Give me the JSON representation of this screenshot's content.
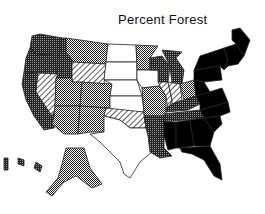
{
  "title": "Percent Forest",
  "categories": [
    {
      "id": "c0",
      "name": "lowest",
      "pattern": "white",
      "color": "#ffffff"
    },
    {
      "id": "c1",
      "name": "low",
      "pattern": "diagonal-hatch",
      "color": "#888888"
    },
    {
      "id": "c2",
      "name": "medium",
      "pattern": "dot-checker",
      "color": "#777777"
    },
    {
      "id": "c3",
      "name": "high",
      "pattern": "dark-checker",
      "color": "#444444"
    },
    {
      "id": "c4",
      "name": "highest",
      "pattern": "solid-black",
      "color": "#000000"
    }
  ],
  "states": [
    {
      "name": "Washington",
      "category": "c3"
    },
    {
      "name": "Oregon",
      "category": "c3"
    },
    {
      "name": "California",
      "category": "c3"
    },
    {
      "name": "Idaho",
      "category": "c3"
    },
    {
      "name": "Nevada",
      "category": "c1"
    },
    {
      "name": "Montana",
      "category": "c2"
    },
    {
      "name": "Wyoming",
      "category": "c1"
    },
    {
      "name": "Utah",
      "category": "c2"
    },
    {
      "name": "Arizona",
      "category": "c2"
    },
    {
      "name": "Colorado",
      "category": "c2"
    },
    {
      "name": "New Mexico",
      "category": "c2"
    },
    {
      "name": "North Dakota",
      "category": "c0"
    },
    {
      "name": "South Dakota",
      "category": "c0"
    },
    {
      "name": "Nebraska",
      "category": "c0"
    },
    {
      "name": "Kansas",
      "category": "c0"
    },
    {
      "name": "Oklahoma",
      "category": "c1"
    },
    {
      "name": "Texas",
      "category": "c0"
    },
    {
      "name": "Minnesota",
      "category": "c2"
    },
    {
      "name": "Iowa",
      "category": "c0"
    },
    {
      "name": "Missouri",
      "category": "c2"
    },
    {
      "name": "Arkansas",
      "category": "c3"
    },
    {
      "name": "Louisiana",
      "category": "c3"
    },
    {
      "name": "Wisconsin",
      "category": "c3"
    },
    {
      "name": "Michigan",
      "category": "c3"
    },
    {
      "name": "Illinois",
      "category": "c1"
    },
    {
      "name": "Indiana",
      "category": "c1"
    },
    {
      "name": "Ohio",
      "category": "c2"
    },
    {
      "name": "Kentucky",
      "category": "c3"
    },
    {
      "name": "Tennessee",
      "category": "c3"
    },
    {
      "name": "Mississippi",
      "category": "c4"
    },
    {
      "name": "Alabama",
      "category": "c4"
    },
    {
      "name": "Georgia",
      "category": "c4"
    },
    {
      "name": "Florida",
      "category": "c4"
    },
    {
      "name": "South Carolina",
      "category": "c4"
    },
    {
      "name": "North Carolina",
      "category": "c4"
    },
    {
      "name": "Virginia",
      "category": "c4"
    },
    {
      "name": "West Virginia",
      "category": "c4"
    },
    {
      "name": "Pennsylvania",
      "category": "c4"
    },
    {
      "name": "New York",
      "category": "c4"
    },
    {
      "name": "New England",
      "category": "c4"
    },
    {
      "name": "Maine",
      "category": "c4"
    },
    {
      "name": "Alaska",
      "category": "c2"
    },
    {
      "name": "Hawaii",
      "category": "c3"
    }
  ]
}
